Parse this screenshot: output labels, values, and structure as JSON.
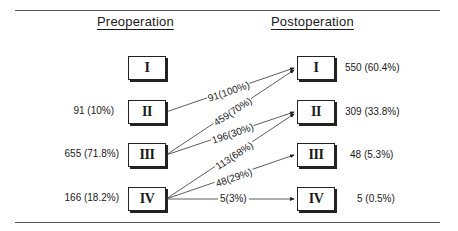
{
  "headings": {
    "pre": "Preoperation",
    "post": "Postoperation"
  },
  "pre": [
    {
      "grade": "I",
      "count": ""
    },
    {
      "grade": "II",
      "count": "91 (10%)"
    },
    {
      "grade": "III",
      "count": "655 (71.8%)"
    },
    {
      "grade": "IV",
      "count": "166 (18.2%)"
    }
  ],
  "post": [
    {
      "grade": "I",
      "count": "550 (60.4%)"
    },
    {
      "grade": "II",
      "count": "309 (33.8%)"
    },
    {
      "grade": "III",
      "count": "48 (5.3%)"
    },
    {
      "grade": "IV",
      "count": "5 (0.5%)"
    }
  ],
  "flows": [
    {
      "from": "II",
      "to": "I",
      "label": "91(100%)"
    },
    {
      "from": "III",
      "to": "I",
      "label": "459(70%)"
    },
    {
      "from": "III",
      "to": "II",
      "label": "196(30%)"
    },
    {
      "from": "IV",
      "to": "II",
      "label": "113(68%)"
    },
    {
      "from": "IV",
      "to": "III",
      "label": "48(29%)"
    },
    {
      "from": "IV",
      "to": "IV",
      "label": "5(3%)"
    }
  ],
  "caption": "Figure ..."
}
